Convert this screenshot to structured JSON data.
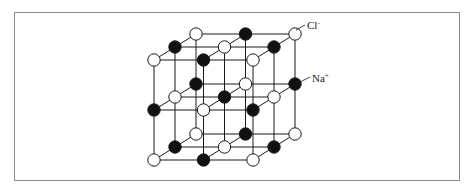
{
  "diagram": {
    "labels": {
      "chloride": "Cl",
      "chloride_charge": "-",
      "sodium": "Na",
      "sodium_charge": "+"
    },
    "legend": {
      "open_circle": "Cl- ion",
      "filled_circle": "Na+ ion"
    },
    "colors": {
      "line": "#1a1a1a",
      "filled_atom": "#111111",
      "open_atom_fill": "#ffffff",
      "frame": "#8a8a8a"
    },
    "lattice": {
      "size": "3x3x3",
      "layers": [
        {
          "name": "top",
          "rows": [
            {
              "name": "back",
              "atoms": [
                "open",
                "filled",
                "open"
              ]
            },
            {
              "name": "mid",
              "atoms": [
                "filled",
                "open",
                "filled"
              ]
            },
            {
              "name": "front",
              "atoms": [
                "open",
                "filled",
                "open"
              ]
            }
          ]
        },
        {
          "name": "middle",
          "rows": [
            {
              "name": "back",
              "atoms": [
                "filled",
                "open",
                "filled"
              ]
            },
            {
              "name": "mid",
              "atoms": [
                "open",
                "filled",
                "open"
              ]
            },
            {
              "name": "front",
              "atoms": [
                "filled",
                "open",
                "filled"
              ]
            }
          ]
        },
        {
          "name": "bottom",
          "rows": [
            {
              "name": "back",
              "atoms": [
                "open",
                "filled",
                "open"
              ]
            },
            {
              "name": "mid",
              "atoms": [
                "filled",
                "open",
                "filled"
              ]
            },
            {
              "name": "front",
              "atoms": [
                "open",
                "filled",
                "open"
              ]
            }
          ]
        }
      ]
    }
  }
}
